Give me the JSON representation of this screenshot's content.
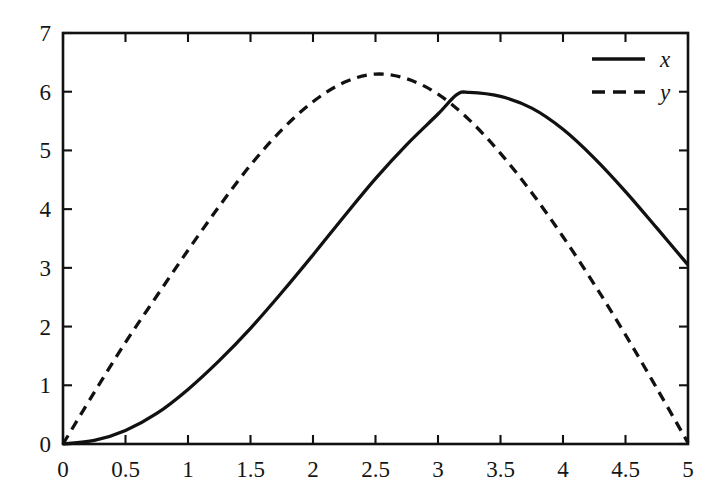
{
  "chart_data": {
    "type": "line",
    "title": "",
    "subtitle": "",
    "xlabel": "",
    "ylabel": "",
    "xlim": [
      0,
      5
    ],
    "ylim": [
      0,
      7
    ],
    "xticks": [
      0,
      0.5,
      1,
      1.5,
      2,
      2.5,
      3,
      3.5,
      4,
      4.5,
      5
    ],
    "yticks": [
      0,
      1,
      2,
      3,
      4,
      5,
      6,
      7
    ],
    "xtick_labels": [
      "0",
      "0.5",
      "1",
      "1.5",
      "2",
      "2.5",
      "3",
      "3.5",
      "4",
      "4.5",
      "5"
    ],
    "ytick_labels": [
      "0",
      "1",
      "2",
      "3",
      "4",
      "5",
      "6",
      "7"
    ],
    "grid": false,
    "box_frame": true,
    "tick_direction": "in",
    "legend_position": "top-right",
    "legend": [
      "x",
      "y"
    ],
    "line_color": "#111111",
    "background_color": "#ffffff",
    "annotations": [],
    "series": [
      {
        "name": "x",
        "style": "solid",
        "color": "#111111",
        "x": [
          0,
          0.25,
          0.5,
          0.75,
          1,
          1.25,
          1.5,
          1.75,
          2,
          2.25,
          2.5,
          2.75,
          3,
          3.15,
          3.25,
          3.5,
          3.75,
          4,
          4.25,
          4.5,
          4.75,
          5
        ],
        "y": [
          0,
          0.06,
          0.23,
          0.52,
          0.93,
          1.42,
          1.97,
          2.58,
          3.22,
          3.88,
          4.52,
          5.1,
          5.62,
          5.95,
          5.99,
          5.92,
          5.72,
          5.36,
          4.87,
          4.3,
          3.68,
          3.05
        ]
      },
      {
        "name": "y",
        "style": "dashed",
        "color": "#111111",
        "dash_pattern": [
          10,
          7
        ],
        "x": [
          0,
          0.25,
          0.5,
          0.75,
          1,
          1.25,
          1.5,
          1.75,
          2,
          2.25,
          2.5,
          2.75,
          3,
          3.25,
          3.5,
          3.75,
          4,
          4.25,
          4.5,
          4.75,
          5
        ],
        "y": [
          0,
          0.88,
          1.73,
          2.52,
          3.3,
          4.05,
          4.75,
          5.35,
          5.83,
          6.16,
          6.3,
          6.22,
          5.96,
          5.52,
          4.95,
          4.28,
          3.53,
          2.72,
          1.86,
          0.95,
          0.02
        ]
      }
    ]
  },
  "legend": {
    "entries": [
      {
        "label": "x",
        "style": "solid"
      },
      {
        "label": "y",
        "style": "dashed"
      }
    ]
  }
}
